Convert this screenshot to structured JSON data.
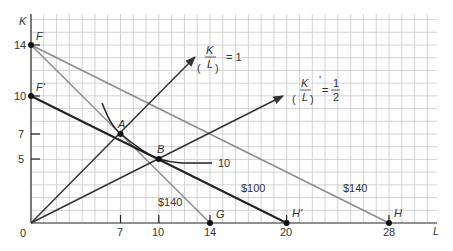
{
  "chart_data": {
    "type": "line",
    "title": "",
    "xlabel": "L",
    "ylabel": "K",
    "xlim": [
      0,
      31.7
    ],
    "ylim": [
      0,
      16.3
    ],
    "grid": true,
    "x_ticks": [
      "7",
      "10",
      "14",
      "20",
      "28"
    ],
    "y_ticks": [
      "5",
      "7",
      "10",
      "14"
    ],
    "origin_label": "0",
    "isocost_lines": [
      {
        "name": "FG",
        "label": "$140",
        "from": [
          0,
          14
        ],
        "to": [
          14,
          0
        ]
      },
      {
        "name": "FH",
        "label": "$140",
        "from": [
          0,
          14
        ],
        "to": [
          28,
          0
        ]
      },
      {
        "name": "F'H'",
        "label": "$100",
        "from": [
          0,
          10
        ],
        "to": [
          20,
          0
        ]
      }
    ],
    "rays": [
      {
        "name": "K/L = 1",
        "label_left": "K",
        "label_den": "L",
        "label_rhs": "= 1",
        "from": [
          0,
          0
        ],
        "to": [
          12.8,
          13
        ]
      },
      {
        "name": "(K/L)' = 1/2",
        "label_left": "K",
        "label_den": "L",
        "label_rhs_num": "1",
        "label_rhs_den": "2",
        "from": [
          0,
          0
        ],
        "to": [
          19.7,
          10
        ]
      }
    ],
    "isoquant": {
      "label": "10",
      "points": [
        [
          7.3,
          9
        ],
        [
          7,
          7
        ],
        [
          10,
          5
        ],
        [
          12,
          4.6
        ],
        [
          15,
          4.6
        ]
      ]
    },
    "points": [
      {
        "name": "F",
        "x": 0,
        "y": 14
      },
      {
        "name": "F'",
        "x": 0,
        "y": 10
      },
      {
        "name": "A",
        "x": 7,
        "y": 7
      },
      {
        "name": "B",
        "x": 10,
        "y": 5
      },
      {
        "name": "G",
        "x": 14,
        "y": 0
      },
      {
        "name": "H'",
        "x": 20,
        "y": 0
      },
      {
        "name": "H",
        "x": 28,
        "y": 0
      }
    ]
  },
  "labels": {
    "y_axis": "K",
    "x_axis": "L",
    "origin": "0",
    "F": "F",
    "Fp": "F'",
    "A": "A",
    "B": "B",
    "G": "G",
    "Hp": "H'",
    "H": "H",
    "isoquant": "10",
    "cost_100": "$100",
    "cost_140_fh": "$140",
    "cost_140_fg": "$140",
    "ray1_num": "K",
    "ray1_den": "L",
    "ray1_rhs": "= 1",
    "ray2_num": "K",
    "ray2_den": "L",
    "ray2_prime": "'",
    "ray2_eq": "=",
    "ray2_rhs_num": "1",
    "ray2_rhs_den": "2",
    "tick_7": "7",
    "tick_10": "10",
    "tick_14": "14",
    "tick_20": "20",
    "tick_28": "28",
    "ytick_5": "5",
    "ytick_7": "7",
    "ytick_10": "10",
    "ytick_14": "14"
  }
}
